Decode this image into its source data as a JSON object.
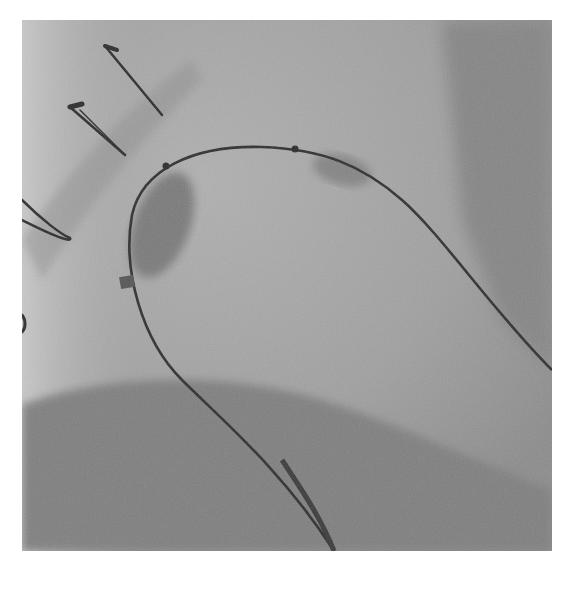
{
  "image": {
    "description": "Fluoroscopic angiography image showing a curved catheter/guidewire forming an arch, with sternal wire loops at upper left and a darker shadow region at the bottom",
    "colors": {
      "background": "#ffffff",
      "field": "#9a9a9a",
      "light_region": "#b2b2b2",
      "dark_region": "#808080",
      "wire": "#2e2e2e"
    }
  }
}
